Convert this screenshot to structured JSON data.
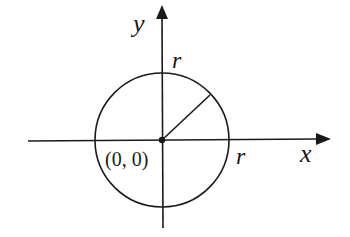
{
  "diagram": {
    "axes": {
      "x_label": "x",
      "y_label": "y"
    },
    "origin_label": "(0, 0)",
    "radius_label_top": "r",
    "radius_label_right": "r",
    "colors": {
      "stroke": "#1a1a1a",
      "background": "#ffffff"
    }
  }
}
